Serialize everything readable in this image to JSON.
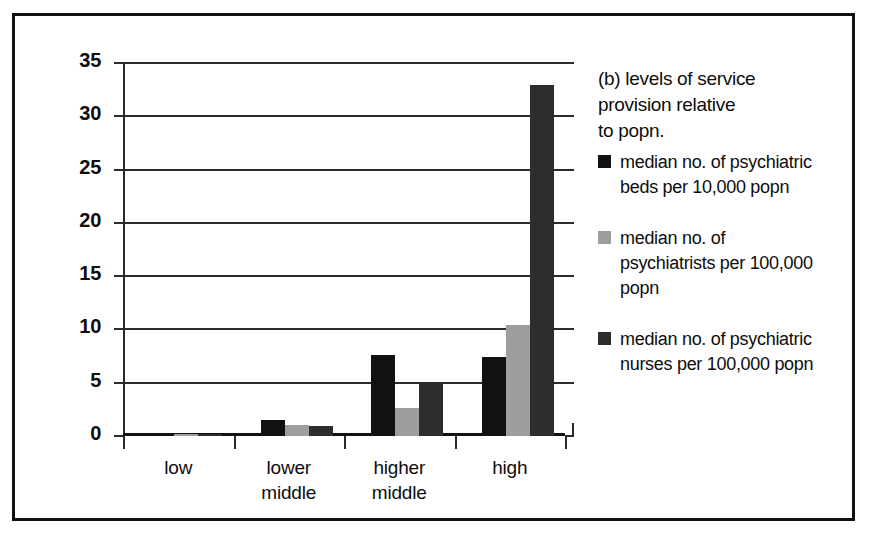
{
  "chart_data": {
    "type": "bar",
    "xlabel": "",
    "ylabel": "",
    "ylim": [
      0,
      35
    ],
    "yticks": [
      0,
      5,
      10,
      15,
      20,
      25,
      30,
      35
    ],
    "grid": true,
    "legend_position": "right",
    "categories": [
      "low",
      "lower middle",
      "higher middle",
      "high"
    ],
    "category_lines": [
      [
        "low"
      ],
      [
        "lower",
        "middle"
      ],
      [
        "higher",
        "middle"
      ],
      [
        "high"
      ]
    ],
    "series": [
      {
        "name": "median no. of psychiatric beds per 10,000 popn",
        "name_lines": [
          "median no. of psychiatric",
          "beds per 10,000 popn"
        ],
        "color": "#111111",
        "values": [
          0.2,
          1.5,
          7.6,
          7.4
        ]
      },
      {
        "name": "median no. of psychiatrists per 100,000 popn",
        "name_lines": [
          "median no. of",
          "psychiatrists per 100,000",
          "popn"
        ],
        "color": "#9e9e9e",
        "values": [
          0.15,
          1.0,
          2.6,
          10.4
        ]
      },
      {
        "name": "median no. of psychiatric nurses per 100,000 popn",
        "name_lines": [
          "median no. of psychiatric",
          "nurses per 100,000 popn"
        ],
        "color": "#2d2d2d",
        "values": [
          0.1,
          0.9,
          5.1,
          32.9
        ]
      }
    ]
  },
  "legend": {
    "title_lines": [
      "(b) levels of service",
      "provision relative",
      "to popn."
    ]
  }
}
